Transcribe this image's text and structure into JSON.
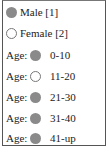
{
  "legend": {
    "gender": [
      {
        "label": "Male [1]",
        "marker": "filled"
      },
      {
        "label": "Female [2]",
        "marker": "hollow"
      }
    ],
    "age_prefix": "Age:",
    "ages": [
      {
        "label": "0-10",
        "marker": "filled"
      },
      {
        "label": "11-20",
        "marker": "hollow"
      },
      {
        "label": "21-30",
        "marker": "filled"
      },
      {
        "label": "31-40",
        "marker": "filled"
      },
      {
        "label": "41-up",
        "marker": "filled"
      }
    ]
  },
  "colors": {
    "filled": "#8a8a8a",
    "border": "#555555"
  }
}
